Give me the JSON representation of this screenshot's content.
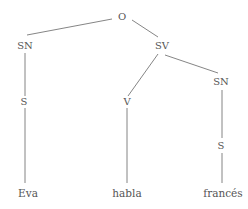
{
  "diagram": {
    "type": "syntax-tree",
    "line_color": "#777777",
    "text_color": "#555555",
    "nodes": {
      "root": {
        "label": "O",
        "x": 122,
        "y": 17
      },
      "sn_subject": {
        "label": "SN",
        "x": 25,
        "y": 46
      },
      "sv": {
        "label": "SV",
        "x": 162,
        "y": 46
      },
      "s_subject": {
        "label": "S",
        "x": 24,
        "y": 102
      },
      "v": {
        "label": "V",
        "x": 127,
        "y": 102
      },
      "sn_object": {
        "label": "SN",
        "x": 221,
        "y": 82
      },
      "s_object": {
        "label": "S",
        "x": 221,
        "y": 146
      },
      "leaf_eva": {
        "label": "Eva",
        "x": 28,
        "y": 193
      },
      "leaf_habla": {
        "label": "habla",
        "x": 127,
        "y": 193
      },
      "leaf_frances": {
        "label": "francés",
        "x": 223,
        "y": 193
      }
    },
    "edges": [
      {
        "from": "root",
        "to": "sn_subject",
        "x1": 112,
        "y1": 19,
        "x2": 27,
        "y2": 35
      },
      {
        "from": "root",
        "to": "sv",
        "x1": 132,
        "y1": 20,
        "x2": 158,
        "y2": 37
      },
      {
        "from": "sn_subject",
        "to": "s_subject",
        "x1": 25,
        "y1": 53,
        "x2": 25,
        "y2": 96
      },
      {
        "from": "sv",
        "to": "v",
        "x1": 158,
        "y1": 54,
        "x2": 128,
        "y2": 96
      },
      {
        "from": "sv",
        "to": "sn_object",
        "x1": 165,
        "y1": 55,
        "x2": 218,
        "y2": 73
      },
      {
        "from": "s_subject",
        "to": "leaf_eva",
        "x1": 25,
        "y1": 108,
        "x2": 25,
        "y2": 183
      },
      {
        "from": "v",
        "to": "leaf_habla",
        "x1": 127,
        "y1": 108,
        "x2": 127,
        "y2": 183
      },
      {
        "from": "sn_object",
        "to": "s_object",
        "x1": 222,
        "y1": 90,
        "x2": 222,
        "y2": 138
      },
      {
        "from": "s_object",
        "to": "leaf_frances",
        "x1": 222,
        "y1": 153,
        "x2": 222,
        "y2": 183
      }
    ]
  }
}
